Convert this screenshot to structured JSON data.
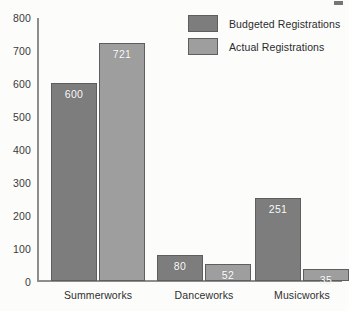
{
  "chart_data": {
    "type": "bar",
    "title": "",
    "xlabel": "",
    "ylabel": "",
    "ylim": [
      0,
      800
    ],
    "ystep": 100,
    "grid": false,
    "legend_position": "top-right",
    "categories": [
      "Summerworks",
      "Danceworks",
      "Musicworks"
    ],
    "yticks": [
      "0",
      "100",
      "200",
      "300",
      "400",
      "500",
      "600",
      "700",
      "800"
    ],
    "series": [
      {
        "name": "Budgeted Registrations",
        "color": "#7d7d7d",
        "values": [
          600,
          80,
          251
        ],
        "labels": [
          "600",
          "80",
          "251"
        ]
      },
      {
        "name": "Actual Registrations",
        "color": "#9e9e9e",
        "values": [
          721,
          52,
          35
        ],
        "labels": [
          "721",
          "52",
          "35"
        ]
      }
    ]
  },
  "legend": {
    "items": [
      {
        "label": "Budgeted Registrations",
        "swatch": "budgeted"
      },
      {
        "label": "Actual Registrations",
        "swatch": "actual"
      }
    ]
  },
  "colors": {
    "budgeted": "#7d7d7d",
    "actual": "#9e9e9e",
    "axis": "#8d8d8d",
    "background": "#fcfcfb",
    "value_label": "#ffffff"
  }
}
